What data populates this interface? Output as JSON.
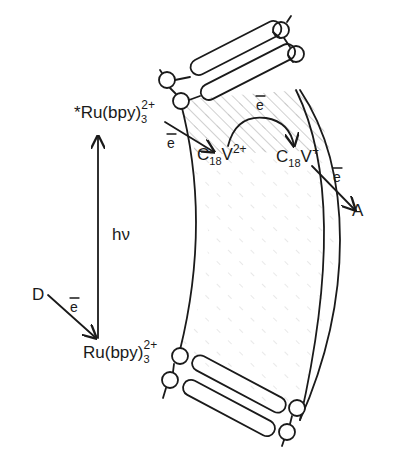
{
  "diagram": {
    "type": "photoinduced electron transfer across vesicle bilayer membrane",
    "labels": {
      "excited_sensitizer": {
        "star": "*",
        "base": "Ru(bpy)",
        "sub": "3",
        "sup": "2+"
      },
      "ground_sensitizer": {
        "base": "Ru(bpy)",
        "sub": "3",
        "sup": "2+"
      },
      "viologen_oxidized": {
        "base": "C",
        "sub": "18",
        "mid": "V",
        "sup": "2+"
      },
      "viologen_reduced": {
        "base": "C",
        "sub": "18",
        "mid": "V",
        "sup": "+"
      },
      "donor": "D",
      "acceptor": "A",
      "light": "hν",
      "electron": "e"
    },
    "arrows": [
      {
        "from": "Ru(bpy)3 2+",
        "to": "*Ru(bpy)3 2+",
        "label": "hν"
      },
      {
        "from": "*Ru(bpy)3 2+",
        "to": "C18V2+",
        "label": "e"
      },
      {
        "from": "C18V2+",
        "to": "C18V+",
        "label": "e",
        "style": "curved"
      },
      {
        "from": "C18V+",
        "to": "A",
        "label": "e"
      },
      {
        "from": "D",
        "to": "Ru(bpy)3 2+",
        "label": "e"
      }
    ],
    "colors": {
      "ink": "#1a1a1a",
      "background": "#ffffff",
      "hatch": "#8a8a8a"
    }
  }
}
